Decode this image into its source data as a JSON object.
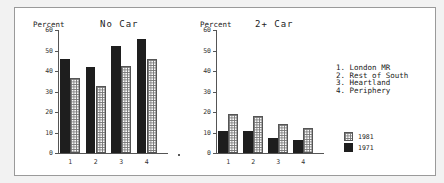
{
  "chart_data": [
    {
      "type": "bar",
      "title": "No Car",
      "ylabel": "Percent",
      "xlabel": "",
      "categories": [
        "1",
        "2",
        "3",
        "4"
      ],
      "ylim": [
        0,
        60
      ],
      "yticks": [
        0,
        10,
        20,
        30,
        40,
        50,
        60
      ],
      "series": [
        {
          "name": "1971",
          "values": [
            46,
            42,
            52,
            55.5
          ]
        },
        {
          "name": "1981",
          "values": [
            36.5,
            32.5,
            42.5,
            46
          ]
        }
      ],
      "grid": false
    },
    {
      "type": "bar",
      "title": "2+ Car",
      "ylabel": "Percent",
      "xlabel": "",
      "categories": [
        "1",
        "2",
        "3",
        "4"
      ],
      "ylim": [
        0,
        60
      ],
      "yticks": [
        0,
        10,
        20,
        30,
        40,
        50,
        60
      ],
      "series": [
        {
          "name": "1971",
          "values": [
            10.5,
            10.5,
            7.5,
            6.5
          ]
        },
        {
          "name": "1981",
          "values": [
            19,
            18,
            14,
            12
          ]
        }
      ],
      "grid": false
    }
  ],
  "panels": [
    {
      "title": "No Car",
      "ylabel": "Percent"
    },
    {
      "title": "2+ Car",
      "ylabel": "Percent"
    }
  ],
  "yticks": [
    "0",
    "10",
    "20",
    "30",
    "40",
    "50",
    "60"
  ],
  "xticks": [
    "1",
    "2",
    "3",
    "4"
  ],
  "category_key": [
    "1. London MR",
    "2. Rest of South",
    "3. Heartland",
    "4. Periphery"
  ],
  "legend": [
    {
      "label": "1981",
      "style": "hatched"
    },
    {
      "label": "1971",
      "style": "solid-dark"
    }
  ],
  "colors": {
    "dark": "#1e1e1e",
    "hatch_line": "#777777",
    "axis": "#555555"
  }
}
